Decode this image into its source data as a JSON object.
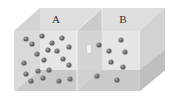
{
  "diagram": {
    "type": "two-chamber gas box",
    "chambers": [
      {
        "label": "A",
        "molecule_count": 20
      },
      {
        "label": "B",
        "molecule_count": 8
      }
    ],
    "divider_hole": true,
    "colors": {
      "top_face": "#d9d9d9",
      "back_wall": "#e6e6e6",
      "front_face": "#dcdcdc",
      "floor": "#b9b9b9",
      "right_face": "#cfcfcf",
      "divider": "#c8c8c8",
      "molecule": "#2e2e2e"
    },
    "molecules_A": [
      [
        26,
        39
      ],
      [
        42,
        36
      ],
      [
        32,
        44
      ],
      [
        52,
        43
      ],
      [
        62,
        38
      ],
      [
        69,
        47
      ],
      [
        48,
        50
      ],
      [
        57,
        51
      ],
      [
        37,
        54
      ],
      [
        44,
        60
      ],
      [
        63,
        59
      ],
      [
        24,
        63
      ],
      [
        69,
        65
      ],
      [
        38,
        71
      ],
      [
        49,
        70
      ],
      [
        26,
        74
      ],
      [
        43,
        78
      ],
      [
        31,
        81
      ],
      [
        59,
        81
      ],
      [
        70,
        79
      ]
    ],
    "molecules_B": [
      [
        99,
        45
      ],
      [
        121,
        40
      ],
      [
        109,
        51
      ],
      [
        125,
        52
      ],
      [
        111,
        62
      ],
      [
        123,
        67
      ],
      [
        97,
        76
      ],
      [
        117,
        80
      ]
    ]
  }
}
